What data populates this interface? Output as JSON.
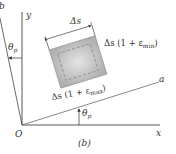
{
  "figure": {
    "caption": "(b)",
    "axes": {
      "x_label": "x",
      "y_label": "y",
      "a_label": "a",
      "b_label": "b",
      "origin_label": "O"
    },
    "angles": {
      "theta_y": "θ",
      "theta_y_sub": "p",
      "theta_x": "θ",
      "theta_x_sub": "p"
    },
    "element": {
      "dim_top": "Δs",
      "label_right_prefix": "Δs (1 + ε",
      "label_right_sub": "min",
      "label_right_suffix": ")",
      "label_bottom_prefix": "Δs (1 + ε",
      "label_bottom_sub": "max",
      "label_bottom_suffix": ")"
    },
    "colors": {
      "line": "#333333",
      "element_fill": "#c8c8c8",
      "element_inner": "#dcdcdc"
    }
  }
}
